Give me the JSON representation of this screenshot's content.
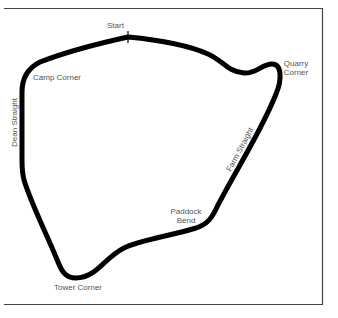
{
  "map": {
    "type": "circuit-layout",
    "colors": {
      "track": "#000000",
      "frame": "#444444",
      "label": "#555555",
      "background": "#ffffff"
    },
    "start_marker": {
      "x": 128,
      "y": 37
    },
    "labels": {
      "start": "Start",
      "camp_corner": "Camp Corner",
      "quarry_corner_line1": "Quarry",
      "quarry_corner_line2": "Corner",
      "dean_straight": "Dean Straight",
      "farm_straight": "Farm Straight",
      "paddock_bend_line1": "Paddock",
      "paddock_bend_line2": "Bend",
      "tower_corner": "Tower Corner"
    }
  }
}
